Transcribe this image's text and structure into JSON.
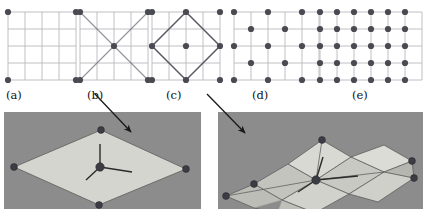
{
  "figure": {
    "caption_labels": [
      "(a)",
      "(b)",
      "(c)",
      "(d)",
      "(e)"
    ],
    "colors": {
      "dot": "#4a4a52",
      "grid_line": "#b9b9bd",
      "overlay_line": "#6e6e78",
      "diamond_line": "#5a5a64",
      "arrow": "#1a1a1a",
      "render_background": "#8c8c8c",
      "mesh_light": "#d8d8d2",
      "mesh_mid": "#c2c2bc",
      "mesh_dark": "#a6a6a0"
    }
  },
  "panels": [
    {
      "id": "panel-a",
      "label": "(a)",
      "label_x": 6,
      "label_y": 90,
      "grid": {
        "x": 8,
        "y": 12,
        "cols": 4,
        "rows": 4,
        "cell": 17
      },
      "dot_points": [
        [
          0,
          0
        ],
        [
          4,
          0
        ],
        [
          0,
          4
        ],
        [
          4,
          4
        ]
      ],
      "overlay_lines": [],
      "diamond": null
    },
    {
      "id": "panel-b",
      "label": "(b)",
      "label_x": 87,
      "label_y": 90,
      "grid": {
        "x": 80,
        "y": 12,
        "cols": 4,
        "rows": 4,
        "cell": 17
      },
      "dot_points": [
        [
          0,
          0
        ],
        [
          4,
          0
        ],
        [
          0,
          4
        ],
        [
          4,
          4
        ],
        [
          2,
          2
        ]
      ],
      "overlay_lines": [
        [
          [
            0,
            0
          ],
          [
            4,
            4
          ]
        ],
        [
          [
            4,
            0
          ],
          [
            0,
            4
          ]
        ]
      ],
      "diamond": null
    },
    {
      "id": "panel-c",
      "label": "(c)",
      "label_x": 166,
      "label_y": 90,
      "grid": {
        "x": 152,
        "y": 12,
        "cols": 4,
        "rows": 4,
        "cell": 17
      },
      "dot_points": [
        [
          0,
          0
        ],
        [
          4,
          0
        ],
        [
          0,
          4
        ],
        [
          4,
          4
        ],
        [
          2,
          2
        ],
        [
          2,
          0
        ],
        [
          0,
          2
        ],
        [
          4,
          2
        ],
        [
          2,
          4
        ]
      ],
      "overlay_lines": [],
      "diamond": [
        [
          2,
          0
        ],
        [
          4,
          2
        ],
        [
          2,
          4
        ],
        [
          0,
          2
        ]
      ]
    },
    {
      "id": "panel-d",
      "label": "(d)",
      "label_x": 252,
      "label_y": 90,
      "grid": {
        "x": 234,
        "y": 12,
        "cols": 5,
        "rows": 4,
        "cell": 17
      },
      "dot_points": [
        [
          0,
          0
        ],
        [
          2,
          0
        ],
        [
          4,
          0
        ],
        [
          0,
          2
        ],
        [
          2,
          2
        ],
        [
          4,
          2
        ],
        [
          0,
          4
        ],
        [
          2,
          4
        ],
        [
          4,
          4
        ],
        [
          1,
          1
        ],
        [
          3,
          1
        ],
        [
          1,
          3
        ],
        [
          3,
          3
        ]
      ],
      "overlay_lines": [],
      "diamond": null
    },
    {
      "id": "panel-e",
      "label": "(e)",
      "label_x": 352,
      "label_y": 90,
      "grid": {
        "x": 320,
        "y": 12,
        "cols": 6,
        "rows": 4,
        "cell": 17
      },
      "dot_points": [
        [
          0,
          0
        ],
        [
          1,
          0
        ],
        [
          2,
          0
        ],
        [
          3,
          0
        ],
        [
          4,
          0
        ],
        [
          5,
          0
        ],
        [
          0,
          1
        ],
        [
          1,
          1
        ],
        [
          2,
          1
        ],
        [
          3,
          1
        ],
        [
          4,
          1
        ],
        [
          5,
          1
        ],
        [
          0,
          2
        ],
        [
          1,
          2
        ],
        [
          2,
          2
        ],
        [
          3,
          2
        ],
        [
          4,
          2
        ],
        [
          5,
          2
        ],
        [
          0,
          3
        ],
        [
          1,
          3
        ],
        [
          2,
          3
        ],
        [
          3,
          3
        ],
        [
          4,
          3
        ],
        [
          5,
          3
        ],
        [
          0,
          4
        ],
        [
          1,
          4
        ],
        [
          2,
          4
        ],
        [
          3,
          4
        ],
        [
          4,
          4
        ],
        [
          5,
          4
        ]
      ],
      "overlay_lines": [],
      "diamond": null
    }
  ],
  "arrows": [
    {
      "id": "arrow-b-to-left-render",
      "from_x": 95,
      "from_y": 94,
      "to_x": 131,
      "to_y": 132
    },
    {
      "id": "arrow-c-to-right-render",
      "from_x": 207,
      "from_y": 94,
      "to_x": 245,
      "to_y": 133
    }
  ],
  "renders": [
    {
      "id": "render-left",
      "name": "flat-quad-mesh-render",
      "faces": [
        {
          "pts": [
            [
              97,
              18
            ],
            [
              182,
              57
            ],
            [
              95,
              93
            ],
            [
              10,
              55
            ]
          ],
          "fill": "#d5d5cf"
        }
      ],
      "edges": [
        [
          [
            97,
            18
          ],
          [
            182,
            57
          ]
        ],
        [
          [
            182,
            57
          ],
          [
            95,
            93
          ]
        ],
        [
          [
            95,
            93
          ],
          [
            10,
            55
          ]
        ],
        [
          [
            10,
            55
          ],
          [
            97,
            18
          ]
        ]
      ],
      "vertices": [
        [
          97,
          18
        ],
        [
          182,
          57
        ],
        [
          95,
          93
        ],
        [
          10,
          55
        ],
        [
          96,
          55
        ]
      ],
      "gizmo": {
        "origin": [
          96,
          55
        ],
        "up": [
          96,
          32
        ],
        "right": [
          128,
          60
        ],
        "depth": [
          82,
          68
        ]
      }
    },
    {
      "id": "render-right",
      "name": "subdivided-mesh-render",
      "faces": [
        {
          "pts": [
            [
              70,
              52
            ],
            [
              104,
              28
            ],
            [
              133,
              45
            ],
            [
              98,
              68
            ]
          ],
          "fill": "#d9d9d3"
        },
        {
          "pts": [
            [
              98,
              68
            ],
            [
              133,
              45
            ],
            [
              166,
              60
            ],
            [
              131,
              82
            ]
          ],
          "fill": "#c9c9c3"
        },
        {
          "pts": [
            [
              36,
              72
            ],
            [
              70,
              52
            ],
            [
              98,
              68
            ],
            [
              64,
              88
            ]
          ],
          "fill": "#c4c4be"
        },
        {
          "pts": [
            [
              64,
              88
            ],
            [
              98,
              68
            ],
            [
              131,
              82
            ],
            [
              97,
              101
            ]
          ],
          "fill": "#d2d2cc"
        },
        {
          "pts": [
            [
              133,
              45
            ],
            [
              166,
              33
            ],
            [
              194,
              49
            ],
            [
              166,
              60
            ]
          ],
          "fill": "#dcdcd6"
        },
        {
          "pts": [
            [
              166,
              60
            ],
            [
              194,
              49
            ],
            [
              196,
              66
            ],
            [
              167,
              76
            ]
          ],
          "fill": "#b6b6b0"
        },
        {
          "pts": [
            [
              131,
              82
            ],
            [
              166,
              60
            ],
            [
              196,
              66
            ],
            [
              160,
              90
            ]
          ],
          "fill": "#d0d0ca"
        },
        {
          "pts": [
            [
              36,
              72
            ],
            [
              8,
              84
            ],
            [
              36,
              96
            ],
            [
              64,
              88
            ]
          ],
          "fill": "#bdbdb7"
        },
        {
          "pts": [
            [
              64,
              88
            ],
            [
              97,
              101
            ],
            [
              88,
              108
            ],
            [
              60,
              99
            ]
          ],
          "fill": "#c0c0ba"
        }
      ],
      "edges": [
        [
          [
            104,
            28
          ],
          [
            133,
            45
          ]
        ],
        [
          [
            133,
            45
          ],
          [
            166,
            33
          ]
        ],
        [
          [
            166,
            33
          ],
          [
            194,
            49
          ]
        ],
        [
          [
            194,
            49
          ],
          [
            196,
            66
          ]
        ],
        [
          [
            196,
            66
          ],
          [
            160,
            90
          ]
        ],
        [
          [
            160,
            90
          ],
          [
            131,
            82
          ]
        ],
        [
          [
            131,
            82
          ],
          [
            97,
            101
          ]
        ],
        [
          [
            97,
            101
          ],
          [
            88,
            108
          ]
        ],
        [
          [
            88,
            108
          ],
          [
            36,
            96
          ]
        ],
        [
          [
            36,
            96
          ],
          [
            8,
            84
          ]
        ],
        [
          [
            8,
            84
          ],
          [
            36,
            72
          ]
        ],
        [
          [
            36,
            72
          ],
          [
            70,
            52
          ]
        ],
        [
          [
            70,
            52
          ],
          [
            104,
            28
          ]
        ],
        [
          [
            70,
            52
          ],
          [
            98,
            68
          ]
        ],
        [
          [
            98,
            68
          ],
          [
            133,
            45
          ]
        ],
        [
          [
            98,
            68
          ],
          [
            131,
            82
          ]
        ],
        [
          [
            98,
            68
          ],
          [
            64,
            88
          ]
        ],
        [
          [
            36,
            72
          ],
          [
            64,
            88
          ]
        ],
        [
          [
            64,
            88
          ],
          [
            97,
            101
          ]
        ],
        [
          [
            133,
            45
          ],
          [
            166,
            60
          ]
        ],
        [
          [
            166,
            60
          ],
          [
            196,
            66
          ]
        ],
        [
          [
            166,
            60
          ],
          [
            194,
            49
          ]
        ],
        [
          [
            131,
            82
          ],
          [
            166,
            60
          ]
        ],
        [
          [
            60,
            99
          ],
          [
            88,
            108
          ]
        ],
        [
          [
            104,
            28
          ],
          [
            98,
            68
          ]
        ],
        [
          [
            98,
            68
          ],
          [
            166,
            60
          ]
        ],
        [
          [
            8,
            84
          ],
          [
            98,
            68
          ]
        ]
      ],
      "vertices": [
        [
          104,
          28
        ],
        [
          194,
          49
        ],
        [
          196,
          66
        ],
        [
          88,
          108
        ],
        [
          8,
          84
        ],
        [
          36,
          72
        ],
        [
          98,
          68
        ]
      ],
      "gizmo": {
        "origin": [
          98,
          68
        ],
        "up": [
          105,
          45
        ],
        "right": [
          140,
          64
        ],
        "depth": [
          80,
          80
        ]
      }
    }
  ]
}
